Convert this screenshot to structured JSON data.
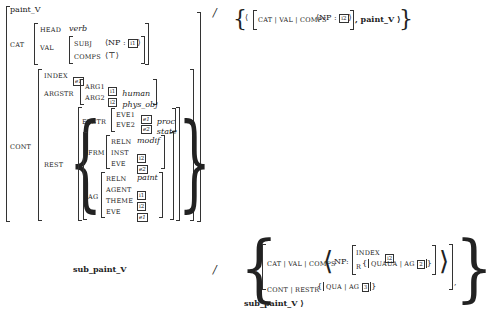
{
  "left_avm": {
    "type": "paint_V",
    "cat": {
      "label": "CAT",
      "head_label": "HEAD",
      "head_value": "verb",
      "val_label": "VAL",
      "subj_label": "SUBJ",
      "subj_value": "⟨NP : ",
      "subj_tag": "i1",
      "subj_close": "⟩",
      "comps_label": "COMPS",
      "comps_value": "⟨⊤⟩"
    },
    "cont": {
      "label": "CONT",
      "index_label": "INDEX",
      "index_tag": "e1",
      "argstr_label": "ARGSTR",
      "arg1_label": "ARG1",
      "arg1_tag": "i1",
      "arg1_value": "human",
      "arg2_label": "ARG2",
      "arg2_tag": "i2",
      "arg2_value": "phys_obj",
      "rest_label": "REST",
      "evstr_label": "EVSTR",
      "eve1_label": "EVE1",
      "eve1_tag": "e1",
      "eve1_value": "proc",
      "eve2_label": "EVE2",
      "eve2_tag": "e2",
      "eve2_value": "state",
      "frm_label": "FRM",
      "frm_reln_label": "RELN",
      "frm_reln_value": "modif",
      "frm_inst_label": "INST",
      "frm_inst_tag": "i2",
      "frm_eve_label": "EVE",
      "frm_eve_tag": "e2",
      "ag_label": "AG",
      "ag_reln_label": "RELN",
      "ag_reln_value": "paint",
      "ag_agent_label": "AGENT",
      "ag_agent_tag": "i1",
      "ag_theme_label": "THEME",
      "ag_theme_tag": "i2",
      "ag_eve_label": "EVE",
      "ag_eve_tag": "e1"
    }
  },
  "slash_1": "/",
  "right_default_1": {
    "path": "CAT | VAL | COMPS",
    "np": "⟨NP : ",
    "tag": "i2",
    "np_close": "⟩",
    "type": ", paint_V ⟩"
  },
  "sub_type": "sub_paint_V",
  "slash_2": "/",
  "right_default_2": {
    "path1": "CAT | VAL | COMPS",
    "np": "NP:",
    "index_label": "INDEX",
    "index_tag": "i2",
    "r_label": "R",
    "r_value": "QUAUA | AG",
    "r_tag": "2",
    "path2": "CONT | RESTR",
    "restr_value": "QUA | AG",
    "restr_tag": "3",
    "type": "sub_paint_V ⟩"
  }
}
